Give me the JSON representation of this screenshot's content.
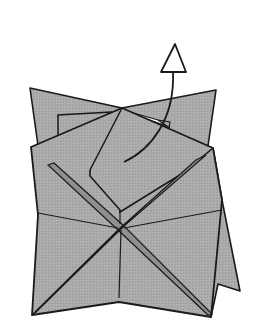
{
  "diagram": {
    "title": "Origami folding step",
    "colors": {
      "paper": "#a9a9a9",
      "paper_dark": "#8f8f8f",
      "line": "#1a1a1a",
      "background": "#ffffff",
      "arrow_fill": "#ffffff"
    },
    "arrow": {
      "type": "hollow-arrow",
      "direction": "up",
      "meaning": "lift flap"
    }
  }
}
